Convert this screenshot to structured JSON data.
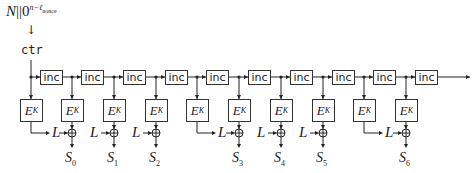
{
  "diagram": {
    "nonce_input": {
      "base": "N",
      "concat": "||",
      "padding": "0",
      "exponent": "n−ℓ",
      "exponent_sub": "nonce"
    },
    "arrow_down": "↓",
    "counter_label": "ctr",
    "inc_label": "inc",
    "cipher_label": {
      "base": "E",
      "sub": "K"
    },
    "mask_label": "L",
    "stages": [
      {
        "x": 31,
        "type": "L-source"
      },
      {
        "x": 72,
        "type": "output",
        "output": {
          "base": "S",
          "sub": "0"
        }
      },
      {
        "x": 114,
        "type": "output",
        "output": {
          "base": "S",
          "sub": "1"
        }
      },
      {
        "x": 156,
        "type": "output",
        "output": {
          "base": "S",
          "sub": "2"
        }
      },
      {
        "x": 197,
        "type": "L-source"
      },
      {
        "x": 239,
        "type": "output",
        "output": {
          "base": "S",
          "sub": "3"
        }
      },
      {
        "x": 281,
        "type": "output",
        "output": {
          "base": "S",
          "sub": "4"
        }
      },
      {
        "x": 323,
        "type": "output",
        "output": {
          "base": "S",
          "sub": "5"
        }
      },
      {
        "x": 364,
        "type": "L-source"
      },
      {
        "x": 406,
        "type": "output",
        "output": {
          "base": "S",
          "sub": "6"
        }
      }
    ],
    "inc_count": 10
  }
}
